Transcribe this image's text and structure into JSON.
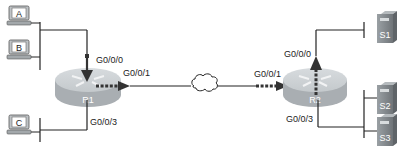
{
  "diagram": {
    "hosts": [
      {
        "id": "A",
        "label": "A"
      },
      {
        "id": "B",
        "label": "B"
      },
      {
        "id": "C",
        "label": "C"
      }
    ],
    "routers": [
      {
        "id": "R1",
        "label": "R1"
      },
      {
        "id": "R2",
        "label": "R2"
      }
    ],
    "servers": [
      {
        "id": "S1",
        "label": "S1"
      },
      {
        "id": "S2",
        "label": "S2"
      },
      {
        "id": "S3",
        "label": "S3"
      }
    ],
    "interfaces": {
      "r1_lan_ab": "G0/0/0",
      "r1_wan": "G0/0/1",
      "r1_lan_c": "G0/0/3",
      "r2_wan": "G0/0/1",
      "r2_lan_s1": "G0/0/0",
      "r2_lan_s2s3": "G0/0/3"
    },
    "cloud": {
      "label": "WAN"
    },
    "colors": {
      "line": "#222222",
      "router_top": "#cfd3d6",
      "router_side": "#a9aeb2",
      "server": "#8a8f93",
      "pc_screen": "#ffffff",
      "arrow": "#333333"
    }
  }
}
